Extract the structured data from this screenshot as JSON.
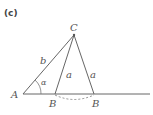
{
  "panel_label": "(c)",
  "points": {
    "A": "A",
    "B1": "B",
    "B2": "B",
    "C": "C"
  },
  "sides": {
    "b": "b",
    "a1": "a",
    "a2": "a"
  },
  "angle": "α",
  "colors": {
    "line": "#666666",
    "text": "#555555"
  }
}
